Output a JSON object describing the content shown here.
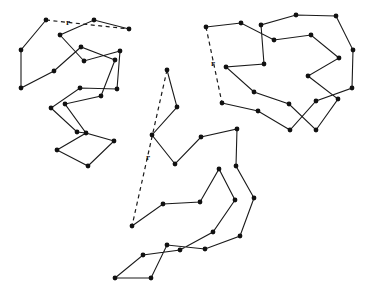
{
  "diagram": {
    "type": "tour-graphs",
    "colors": {
      "line": "#1a1a1a",
      "node": "#111111",
      "background": "#ffffff"
    },
    "tours": [
      {
        "name": "left-tour",
        "path": [
          [
            46,
            20
          ],
          [
            21,
            50
          ],
          [
            21,
            88
          ],
          [
            54,
            71
          ],
          [
            81,
            47
          ],
          [
            115,
            60
          ],
          [
            101,
            96
          ],
          [
            65,
            104
          ],
          [
            86,
            133
          ],
          [
            114,
            141
          ],
          [
            88,
            166
          ],
          [
            57,
            150
          ],
          [
            86,
            133
          ],
          [
            77,
            132
          ],
          [
            51,
            108
          ],
          [
            80,
            88
          ],
          [
            117,
            89
          ],
          [
            120,
            51
          ],
          [
            84,
            61
          ],
          [
            60,
            35
          ],
          [
            94,
            20
          ],
          [
            129,
            29
          ]
        ],
        "dashed": [
          [
            46,
            20
          ],
          [
            129,
            29
          ]
        ],
        "label": {
          "text": "r",
          "x": 66,
          "y": 25
        }
      },
      {
        "name": "center-tour",
        "path": [
          [
            167,
            70
          ],
          [
            177,
            107
          ],
          [
            152,
            135
          ],
          [
            175,
            164
          ],
          [
            201,
            137
          ],
          [
            237,
            129
          ],
          [
            236,
            166
          ],
          [
            254,
            198
          ],
          [
            240,
            236
          ],
          [
            205,
            249
          ],
          [
            167,
            245
          ],
          [
            151,
            278
          ],
          [
            115,
            278
          ],
          [
            143,
            255
          ],
          [
            180,
            250
          ],
          [
            213,
            232
          ],
          [
            235,
            200
          ],
          [
            219,
            169
          ],
          [
            200,
            202
          ],
          [
            163,
            204
          ],
          [
            132,
            226
          ]
        ],
        "dashed": [
          [
            167,
            70
          ],
          [
            132,
            226
          ]
        ],
        "label": {
          "text": "r",
          "x": 146,
          "y": 160
        }
      },
      {
        "name": "right-tour",
        "path": [
          [
            206,
            27
          ],
          [
            241,
            23
          ],
          [
            274,
            40
          ],
          [
            311,
            35
          ],
          [
            339,
            58
          ],
          [
            308,
            76
          ],
          [
            338,
            99
          ],
          [
            316,
            130
          ],
          [
            289,
            104
          ],
          [
            254,
            92
          ],
          [
            226,
            67
          ],
          [
            264,
            64
          ],
          [
            261,
            25
          ],
          [
            296,
            15
          ],
          [
            336,
            16
          ],
          [
            353,
            50
          ],
          [
            352,
            88
          ],
          [
            316,
            101
          ],
          [
            290,
            130
          ],
          [
            258,
            111
          ],
          [
            222,
            103
          ]
        ],
        "dashed": [
          [
            206,
            27
          ],
          [
            222,
            103
          ]
        ],
        "label": {
          "text": "r",
          "x": 211,
          "y": 66
        }
      }
    ]
  }
}
